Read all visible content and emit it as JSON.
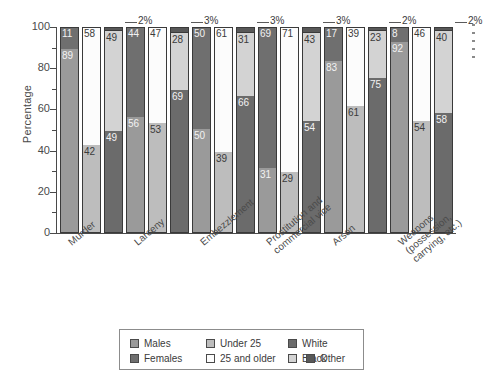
{
  "chart_data": {
    "type": "bar",
    "subtype": "stacked-percentage-grouped",
    "title": "",
    "xlabel": "",
    "ylabel": "Percentage",
    "ylim": [
      0,
      100
    ],
    "ytick_major": [
      0,
      20,
      40,
      60,
      80,
      100
    ],
    "ytick_minor": [
      10,
      30,
      50,
      70,
      90
    ],
    "grid": false,
    "legend_position": "bottom",
    "categories": [
      "Murder",
      "Larceny",
      "Embezzlement",
      "Prostitution and\ncommercial vice",
      "Arson",
      "Weapons\n(possession,\ncarrying, etc.)"
    ],
    "category_lines": [
      [
        "Murder"
      ],
      [
        "Larceny"
      ],
      [
        "Embezzlement"
      ],
      [
        "Prostitution and",
        "commercial vice"
      ],
      [
        "Arson"
      ],
      [
        "Weapons",
        "(possession,",
        "carrying, etc.)"
      ]
    ],
    "bar_types": [
      "sex",
      "age",
      "race"
    ],
    "series": [
      {
        "name": "Males",
        "group": "sex",
        "values": [
          89,
          56,
          50,
          31,
          83,
          92
        ]
      },
      {
        "name": "Females",
        "group": "sex",
        "values": [
          11,
          44,
          50,
          69,
          17,
          8
        ]
      },
      {
        "name": "Under 25",
        "group": "age",
        "values": [
          42,
          53,
          39,
          29,
          61,
          54
        ]
      },
      {
        "name": "25 and older",
        "group": "age",
        "values": [
          58,
          47,
          61,
          71,
          39,
          46
        ]
      },
      {
        "name": "White",
        "group": "race",
        "values": [
          49,
          69,
          66,
          54,
          75,
          58
        ]
      },
      {
        "name": "Black",
        "group": "race",
        "values": [
          49,
          28,
          31,
          43,
          23,
          40
        ]
      },
      {
        "name": "Other",
        "group": "race",
        "values": [
          2,
          3,
          3,
          3,
          2,
          2
        ]
      }
    ],
    "other_callouts": [
      "2%",
      "3%",
      "3%",
      "3%",
      "2%",
      "2%"
    ],
    "colors": {
      "males": "#9a9a9a",
      "females": "#6f6f6f",
      "under25": "#bdbdbd",
      "over25": "#fcfcfc",
      "white": "#6b6b6b",
      "black": "#d3d3d3",
      "other": "#585858",
      "axis": "#4a4a4a",
      "outline": "#3a3a3a",
      "background": "#ffffff"
    }
  },
  "axis": {
    "y_title": "Percentage",
    "y_ticks": [
      "100",
      "80",
      "60",
      "40",
      "20",
      "0"
    ]
  },
  "legend": {
    "items": [
      {
        "label": "Males",
        "swatch": "males"
      },
      {
        "label": "Under 25",
        "swatch": "under25"
      },
      {
        "label": "White",
        "swatch": "white"
      },
      {
        "label": "Females",
        "swatch": "females"
      },
      {
        "label": "25 and older",
        "swatch": "over25"
      },
      {
        "label": "Black",
        "swatch": "black"
      },
      {
        "label": "Other",
        "swatch": "other"
      }
    ]
  }
}
